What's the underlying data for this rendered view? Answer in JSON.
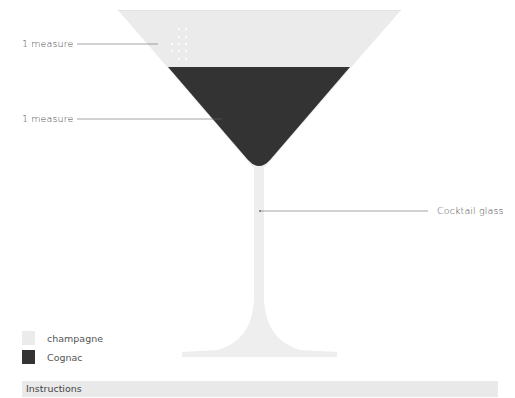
{
  "diagram": {
    "glass_type": "Cocktail glass",
    "layers": [
      {
        "name": "champagne",
        "amount": "1 measure",
        "color": "#ebebeb"
      },
      {
        "name": "Cognac",
        "amount": "1 measure",
        "color": "#333333"
      }
    ],
    "glass_color": "#eeeeee"
  },
  "annotations": {
    "champagne_amount": "1 measure",
    "cognac_amount": "1 measure",
    "glass_label": "Cocktail glass"
  },
  "legend": {
    "items": [
      {
        "label": "champagne",
        "color": "#ebebeb"
      },
      {
        "label": "Cognac",
        "color": "#333333"
      }
    ]
  },
  "instructions": {
    "title": "Instructions"
  }
}
